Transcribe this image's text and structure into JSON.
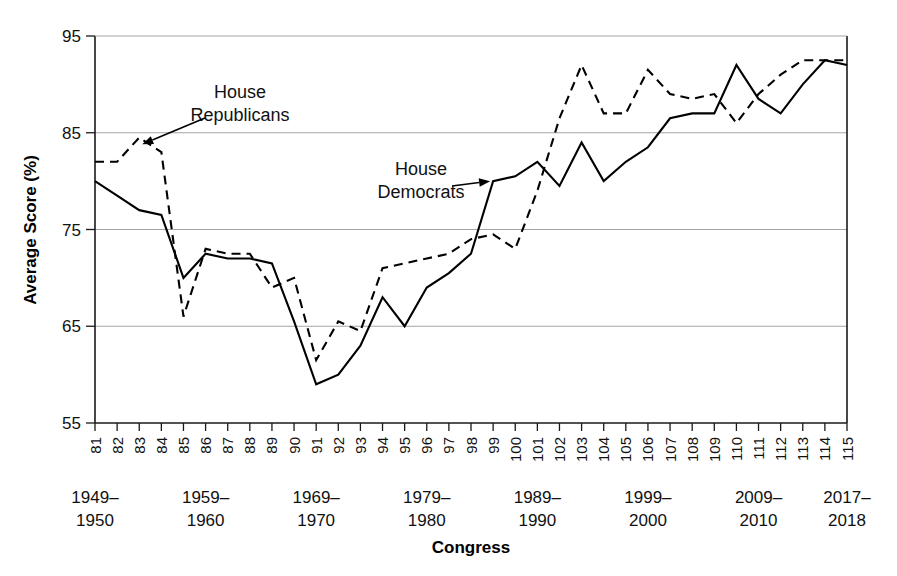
{
  "chart_data": {
    "type": "line",
    "title": "",
    "xlabel": "Congress",
    "ylabel": "Average Score (%)",
    "ylim": [
      55,
      95
    ],
    "yticks": [
      55,
      65,
      75,
      85,
      95
    ],
    "grid": "horizontal",
    "legend_position": "inline-annotations",
    "categories": [
      "81",
      "82",
      "83",
      "84",
      "85",
      "86",
      "87",
      "88",
      "89",
      "90",
      "91",
      "92",
      "93",
      "94",
      "95",
      "96",
      "97",
      "98",
      "99",
      "100",
      "101",
      "102",
      "103",
      "104",
      "105",
      "106",
      "107",
      "108",
      "109",
      "110",
      "111",
      "112",
      "113",
      "114",
      "115"
    ],
    "x_group_labels": [
      {
        "top": "1949–",
        "bottom": "1950",
        "at_category": "81"
      },
      {
        "top": "1959–",
        "bottom": "1960",
        "at_category": "86"
      },
      {
        "top": "1969–",
        "bottom": "1970",
        "at_category": "91"
      },
      {
        "top": "1979–",
        "bottom": "1980",
        "at_category": "96"
      },
      {
        "top": "1989–",
        "bottom": "1990",
        "at_category": "101"
      },
      {
        "top": "1999–",
        "bottom": "2000",
        "at_category": "106"
      },
      {
        "top": "2009–",
        "bottom": "2010",
        "at_category": "111"
      },
      {
        "top": "2017–",
        "bottom": "2018",
        "at_category": "115"
      }
    ],
    "series": [
      {
        "name": "House Democrats",
        "style": "solid",
        "values": [
          80.0,
          78.5,
          77.0,
          76.5,
          70.0,
          72.5,
          72.0,
          72.0,
          71.5,
          65.5,
          59.0,
          60.0,
          63.0,
          68.0,
          65.0,
          69.0,
          70.5,
          72.5,
          80.0,
          80.5,
          82.0,
          79.5,
          84.0,
          80.0,
          82.0,
          83.5,
          86.5,
          87.0,
          87.0,
          92.0,
          88.5,
          87.0,
          90.0,
          92.5,
          92.0
        ]
      },
      {
        "name": "House Republicans",
        "style": "dashed",
        "values": [
          82.0,
          82.0,
          84.5,
          83.0,
          66.0,
          73.0,
          72.5,
          72.5,
          69.0,
          70.0,
          61.5,
          65.5,
          64.5,
          71.0,
          71.5,
          72.0,
          72.5,
          74.0,
          74.5,
          73.0,
          79.0,
          86.5,
          92.0,
          87.0,
          87.0,
          91.5,
          89.0,
          88.5,
          89.0,
          86.0,
          89.0,
          91.0,
          92.5,
          92.5,
          92.5
        ]
      }
    ],
    "annotations": [
      {
        "text_line1": "House",
        "text_line2": "Republicans",
        "points_to_category": "83",
        "points_to_value": 83.5
      },
      {
        "text_line1": "House",
        "text_line2": "Democrats",
        "points_to_category": "99",
        "points_to_value": 80.0
      }
    ]
  },
  "colors": {
    "ink": "#000000",
    "grid": "#9a9a9a",
    "background": "#ffffff"
  }
}
